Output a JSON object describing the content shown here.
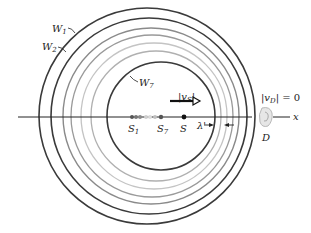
{
  "figure": {
    "type": "doppler-wavefronts",
    "labels": {
      "w1": "W",
      "w1_sub": "1",
      "w2": "W",
      "w2_sub": "2",
      "w7": "W",
      "w7_sub": "7",
      "s1": "S",
      "s1_sub": "1",
      "s7": "S",
      "s7_sub": "7",
      "s": "S",
      "vs": "|v",
      "vs_sub": "S",
      "vs_close": "|",
      "vd": "|v",
      "vd_sub": "D",
      "vd_rest": "| = 0",
      "lambda": "λ'",
      "d": "D",
      "x_axis": "x"
    },
    "colors": {
      "dark_ring": "#3a3a3a",
      "mid_ring": "#8a8a8a",
      "light_ring": "#c4c4c4",
      "axis": "#222222",
      "detector": "#b8b8b8"
    }
  }
}
